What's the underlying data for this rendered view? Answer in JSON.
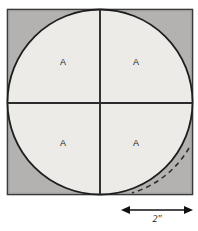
{
  "figure": {
    "square": {
      "x": 7,
      "y": 9,
      "size": 186,
      "fill_color": "#b3b2b0",
      "stroke_color": "#3a3a3a"
    },
    "circle": {
      "cx": 100,
      "cy": 102,
      "r": 93,
      "fill_color": "#ecebe8",
      "stroke_color": "#1e1e1e"
    },
    "divider_lines": {
      "stroke_color": "#2b2b2b",
      "vertical_x": 100,
      "horizontal_y": 103
    },
    "quadrant_labels": [
      {
        "text": "A",
        "x": 63,
        "y": 63
      },
      {
        "text": "A",
        "x": 136,
        "y": 63
      },
      {
        "text": "A",
        "x": 63,
        "y": 144
      },
      {
        "text": "A",
        "x": 136,
        "y": 144
      }
    ],
    "dashed_arc": {
      "stroke_color": "#2b2b2b",
      "dash_pattern": "5,4"
    },
    "dimension": {
      "label": "2\"",
      "label_x": 157,
      "label_y": 219,
      "line_y": 210,
      "x_start": 122,
      "x_end": 192,
      "stroke_color": "#111111"
    }
  }
}
